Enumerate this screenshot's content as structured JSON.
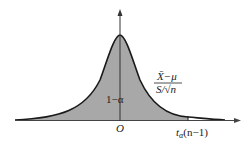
{
  "diagram": {
    "type": "t-distribution-density",
    "colors": {
      "shaded": "#a8a8a8",
      "curve": "#1a1a1a",
      "axis": "#444444",
      "background": "#ffffff"
    },
    "labels": {
      "origin": "O",
      "area": "1−α",
      "statistic_numerator": "X̄−μ",
      "statistic_denominator": "S/√n",
      "critical_t": "t",
      "critical_sub": "α",
      "critical_df": "(n−1)"
    }
  }
}
